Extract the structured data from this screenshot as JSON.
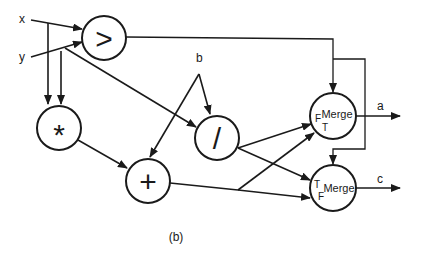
{
  "diagram": {
    "inputs": {
      "x": "x",
      "y": "y",
      "b": "b"
    },
    "nodes": {
      "gt": {
        "symbol": ">",
        "kind": "compare"
      },
      "mul": {
        "symbol": "*",
        "kind": "multiply"
      },
      "div": {
        "symbol": "/",
        "kind": "divide"
      },
      "add": {
        "symbol": "+",
        "kind": "add"
      },
      "merge_a": {
        "label": "Merge",
        "port_top": "F",
        "port_bottom": "T"
      },
      "merge_c": {
        "label": "Merge",
        "port_top": "T",
        "port_bottom": "F"
      }
    },
    "outputs": {
      "a": "a",
      "c": "c"
    },
    "edges": [
      {
        "from": "x",
        "to": "gt"
      },
      {
        "from": "y",
        "to": "gt"
      },
      {
        "from": "x",
        "to": "mul"
      },
      {
        "from": "y",
        "to": "mul"
      },
      {
        "from": "y",
        "to": "div"
      },
      {
        "from": "b",
        "to": "div"
      },
      {
        "from": "b",
        "to": "add"
      },
      {
        "from": "mul",
        "to": "add"
      },
      {
        "from": "gt",
        "to": "merge_a",
        "type": "control"
      },
      {
        "from": "gt",
        "to": "merge_c",
        "type": "control"
      },
      {
        "from": "div",
        "to": "merge_a",
        "port": "F"
      },
      {
        "from": "div",
        "to": "merge_c",
        "port": "T"
      },
      {
        "from": "add",
        "to": "merge_a",
        "port": "T"
      },
      {
        "from": "add",
        "to": "merge_c",
        "port": "F"
      },
      {
        "from": "merge_a",
        "to": "a"
      },
      {
        "from": "merge_c",
        "to": "c"
      }
    ],
    "caption": "(b)",
    "colors": {
      "stroke": "#1a1a1a",
      "background": "#ffffff"
    }
  }
}
